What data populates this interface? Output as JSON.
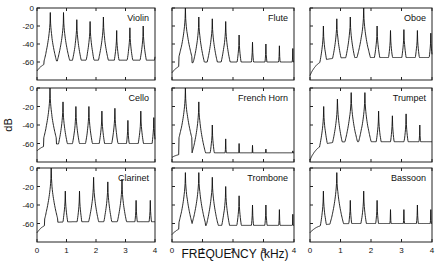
{
  "figure": {
    "ylabel": "dB",
    "xlabel": "FREQUENCY (kHz)",
    "caption_fragment": "FIGURE"
  },
  "axes": {
    "y_ticks": [
      "0",
      "-20",
      "-40",
      "-60"
    ],
    "x_ticks": [
      "0",
      "1",
      "2",
      "3",
      "4"
    ]
  },
  "chart_data": {
    "type": "line",
    "title": "",
    "xlabel": "FREQUENCY (kHz)",
    "ylabel": "dB",
    "xlim": [
      0,
      4
    ],
    "ylim": [
      -80,
      0
    ],
    "grid": false,
    "layout": "3x3 small multiples",
    "panels": [
      {
        "name": "Violin",
        "f0": 0.45,
        "peaks": [
          -5,
          -5,
          -13,
          -15,
          -10,
          -25,
          -22,
          -20,
          -28
        ],
        "floor": -58,
        "start": -70
      },
      {
        "name": "Flute",
        "f0": 0.44,
        "peaks": [
          0,
          -10,
          -12,
          -15,
          -30,
          -38,
          -40,
          -42,
          -45
        ],
        "floor": -60,
        "start": -72
      },
      {
        "name": "Oboe",
        "f0": 0.44,
        "peaks": [
          -20,
          -12,
          -10,
          0,
          -20,
          -25,
          -24,
          -25,
          -28
        ],
        "floor": -55,
        "start": -75
      },
      {
        "name": "Cello",
        "f0": 0.44,
        "peaks": [
          0,
          -15,
          -20,
          -20,
          -25,
          -22,
          -35,
          -25,
          -32
        ],
        "floor": -60,
        "start": -68
      },
      {
        "name": "French Horn",
        "f0": 0.44,
        "peaks": [
          0,
          -15,
          -40,
          -55,
          -60,
          -62,
          -66,
          -70,
          -68
        ],
        "floor": -70,
        "start": -75
      },
      {
        "name": "Trumpet",
        "f0": 0.45,
        "peaks": [
          -20,
          -12,
          -5,
          -5,
          -25,
          -30,
          -28,
          -40,
          -45
        ],
        "floor": -58,
        "start": -78
      },
      {
        "name": "Clarinet",
        "f0": 0.48,
        "peaks": [
          0,
          -25,
          -25,
          -10,
          -15,
          -12,
          -35,
          -35,
          -20
        ],
        "floor": -58,
        "start": -70
      },
      {
        "name": "Trombone",
        "f0": 0.44,
        "peaks": [
          -5,
          -5,
          -10,
          -20,
          -30,
          -40,
          -40,
          -45,
          -50
        ],
        "floor": -62,
        "start": -72
      },
      {
        "name": "Bassoon",
        "f0": 0.44,
        "peaks": [
          -25,
          -5,
          -35,
          -25,
          -35,
          -45,
          -45,
          -40,
          -45
        ],
        "floor": -60,
        "start": -70
      }
    ]
  },
  "panels": [
    {
      "name": "Violin"
    },
    {
      "name": "Flute"
    },
    {
      "name": "Oboe"
    },
    {
      "name": "Cello"
    },
    {
      "name": "French Horn"
    },
    {
      "name": "Trumpet"
    },
    {
      "name": "Clarinet"
    },
    {
      "name": "Trombone"
    },
    {
      "name": "Bassoon"
    }
  ]
}
